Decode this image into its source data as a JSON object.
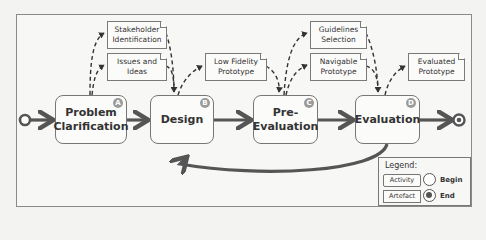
{
  "diagram": {
    "activities": [
      {
        "id": "A",
        "label": "Problem Clarification",
        "lines": [
          "Problem",
          "Clarification"
        ]
      },
      {
        "id": "B",
        "label": "Design",
        "lines": [
          "Design"
        ]
      },
      {
        "id": "C",
        "label": "Pre-Evaluation",
        "lines": [
          "Pre-",
          "Evaluation"
        ]
      },
      {
        "id": "D",
        "label": "Evaluation",
        "lines": [
          "Evaluation"
        ]
      }
    ],
    "artefacts": [
      {
        "label": "Stakeholder Identification",
        "lines": [
          "Stakeholder",
          "Identification"
        ]
      },
      {
        "label": "Issues and Ideas",
        "lines": [
          "Issues and",
          "Ideas"
        ]
      },
      {
        "label": "Low Fidelity Prototype",
        "lines": [
          "Low Fidelity",
          "Prototype"
        ]
      },
      {
        "label": "Guidelines Selection",
        "lines": [
          "Guidelines",
          "Selection"
        ]
      },
      {
        "label": "Navigable Prototype",
        "lines": [
          "Navigable",
          "Prototype"
        ]
      },
      {
        "label": "Evaluated Prototype",
        "lines": [
          "Evaluated",
          "Prototype"
        ]
      }
    ],
    "legend": {
      "title": "Legend:",
      "activity": "Activity",
      "artefact": "Artefact",
      "begin": "Begin",
      "end": "End"
    },
    "colors": {
      "flow_arrow": "#555555",
      "box_border": "#777777",
      "badge": "#9b9b9b"
    }
  }
}
